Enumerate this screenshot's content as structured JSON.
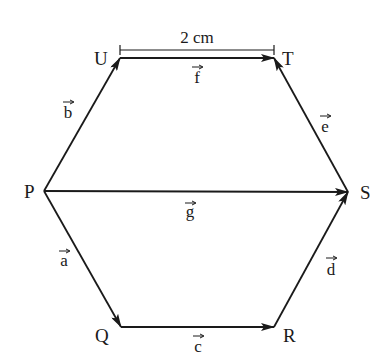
{
  "diagram": {
    "type": "hexagon-vectors",
    "stroke_color": "#1a1a1a",
    "background": "#ffffff",
    "vertices": {
      "P": {
        "label": "P",
        "x": 44,
        "y": 191
      },
      "U": {
        "label": "U",
        "x": 120,
        "y": 58
      },
      "T": {
        "label": "T",
        "x": 274,
        "y": 58
      },
      "S": {
        "label": "S",
        "x": 348,
        "y": 192
      },
      "R": {
        "label": "R",
        "x": 274,
        "y": 327
      },
      "Q": {
        "label": "Q",
        "x": 121,
        "y": 327
      }
    },
    "vectors": [
      {
        "name": "a",
        "label": "a",
        "from": "P",
        "to": "Q"
      },
      {
        "name": "b",
        "label": "b",
        "from": "P",
        "to": "U"
      },
      {
        "name": "c",
        "label": "c",
        "from": "Q",
        "to": "R"
      },
      {
        "name": "d",
        "label": "d",
        "from": "R",
        "to": "S"
      },
      {
        "name": "e",
        "label": "e",
        "from": "S",
        "to": "T"
      },
      {
        "name": "f",
        "label": "f",
        "from": "U",
        "to": "T"
      },
      {
        "name": "g",
        "label": "g",
        "from": "P",
        "to": "S"
      }
    ],
    "dimension": {
      "label": "2 cm",
      "between": [
        "U",
        "T"
      ]
    }
  }
}
